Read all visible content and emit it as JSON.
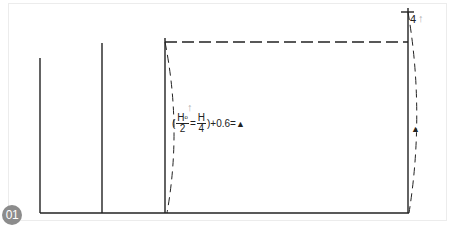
{
  "diagram": {
    "step_number": "01",
    "formula": {
      "open_paren": "(",
      "frac1_num": "H",
      "frac1_sup": "o",
      "frac1_den": "2",
      "equals": "=",
      "frac2_num": "H",
      "frac2_den": "4",
      "tail": ")+0.6=",
      "marker": "▲"
    },
    "arrow_up_glyph": "↑",
    "top_right_label": "4",
    "right_marker": "▲",
    "colors": {
      "line": "#222222",
      "frame": "#e6e6e6",
      "badge": "#8c8c8c",
      "arrow": "#b0b0b0"
    }
  }
}
